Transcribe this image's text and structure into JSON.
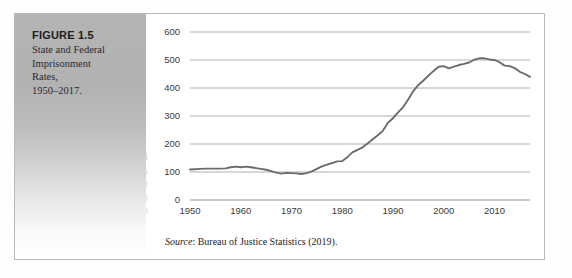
{
  "figure": {
    "label": "FIGURE 1.5",
    "caption_lines": [
      "State and Federal",
      "Imprisonment",
      "Rates,",
      "1950–2017."
    ],
    "source_prefix": "Source",
    "source_text": ": Bureau of Justice Statistics (2019)."
  },
  "ghost_text": {
    "lines": [
      "for these offenses.",
      "and violent crime",
      "states continue",
      "this among more",
      "to reduce their"
    ]
  },
  "axes": {
    "y_ticks": [
      "600",
      "500",
      "400",
      "300",
      "200",
      "100",
      "0"
    ],
    "x_ticks": [
      "1950",
      "1960",
      "1970",
      "1980",
      "1990",
      "2000",
      "2010"
    ]
  },
  "colors": {
    "line": "#6b6b6b",
    "gridline": "#b0b0b0",
    "frame": "#b9b9b9",
    "panel_top": "#b4b4b4",
    "text": "#2b2b2b"
  },
  "chart_data": {
    "type": "line",
    "subtitle": "",
    "xlabel": "",
    "ylabel": "",
    "xlim": [
      1950,
      2017
    ],
    "ylim": [
      0,
      600
    ],
    "grid": true,
    "legend": "none",
    "y_tick_values": [
      0,
      100,
      200,
      300,
      400,
      500,
      600
    ],
    "x_tick_values": [
      1950,
      1960,
      1970,
      1980,
      1990,
      2000,
      2010
    ],
    "annotations": [],
    "series": [
      {
        "name": "Imprisonment rate per 100,000 residents",
        "x": [
          1950,
          1951,
          1952,
          1953,
          1954,
          1955,
          1956,
          1957,
          1958,
          1959,
          1960,
          1961,
          1962,
          1963,
          1964,
          1965,
          1966,
          1967,
          1968,
          1969,
          1970,
          1971,
          1972,
          1973,
          1974,
          1975,
          1976,
          1977,
          1978,
          1979,
          1980,
          1981,
          1982,
          1983,
          1984,
          1985,
          1986,
          1987,
          1988,
          1989,
          1990,
          1991,
          1992,
          1993,
          1994,
          1995,
          1996,
          1997,
          1998,
          1999,
          2000,
          2001,
          2002,
          2003,
          2004,
          2005,
          2006,
          2007,
          2008,
          2009,
          2010,
          2011,
          2012,
          2013,
          2014,
          2015,
          2016,
          2017
        ],
        "values": [
          109,
          110,
          111,
          112,
          112,
          112,
          112,
          113,
          117,
          119,
          117,
          119,
          117,
          114,
          111,
          108,
          103,
          98,
          94,
          97,
          96,
          95,
          93,
          96,
          102,
          111,
          120,
          126,
          132,
          138,
          139,
          153,
          170,
          179,
          188,
          202,
          217,
          231,
          247,
          276,
          292,
          313,
          332,
          359,
          389,
          411,
          427,
          444,
          461,
          476,
          478,
          470,
          476,
          482,
          486,
          491,
          501,
          506,
          506,
          502,
          500,
          492,
          480,
          478,
          471,
          458,
          450,
          440
        ]
      }
    ]
  }
}
